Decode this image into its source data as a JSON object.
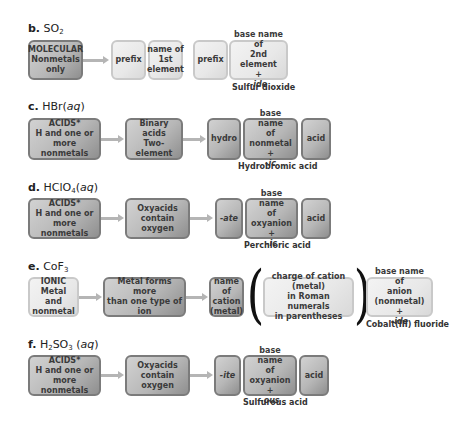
{
  "sections": {
    "b": {
      "letter": "b.",
      "formula_parts": [
        "SO",
        "2",
        ""
      ],
      "category_box": [
        "MOLECULAR",
        "Nonmetals",
        "only"
      ],
      "name_parts": [
        {
          "lines": [
            "prefix"
          ]
        },
        {
          "lines": [
            "name of",
            "1st",
            "element"
          ]
        },
        {
          "lines": [
            "prefix"
          ]
        },
        {
          "lines": [
            "base name of",
            "2nd element"
          ],
          "suffix_prefix": "+ ",
          "suffix": "-ide"
        }
      ],
      "example_name": "Sulfur dioxide"
    },
    "c": {
      "letter": "c.",
      "formula": "HBr",
      "phase": "aq",
      "category_box": [
        "ACIDS*",
        "H and one or",
        "more nonmetals"
      ],
      "subcategory_box": [
        "Binary acids",
        "Two-element"
      ],
      "name_parts": [
        {
          "lines": [
            "hydro"
          ]
        },
        {
          "lines": [
            "base name",
            "of nonmetal"
          ],
          "suffix_prefix": "+ ",
          "suffix": "-ic"
        },
        {
          "lines": [
            "acid"
          ]
        }
      ],
      "example_name": "Hydrobromic acid"
    },
    "d": {
      "letter": "d.",
      "formula_parts": [
        "HClO",
        "4",
        ""
      ],
      "phase": "aq",
      "category_box": [
        "ACIDS*",
        "H and one or",
        "more nonmetals"
      ],
      "subcategory_box": [
        "Oxyacids",
        "contain oxygen"
      ],
      "name_parts": [
        {
          "lines": [
            "-ate"
          ]
        },
        {
          "lines": [
            "base name",
            "of oxyanion"
          ],
          "suffix_prefix": "+ ",
          "suffix": "-ic"
        },
        {
          "lines": [
            "acid"
          ]
        }
      ],
      "example_name": "Perchloric acid"
    },
    "e": {
      "letter": "e.",
      "formula_parts": [
        "CoF",
        "3",
        ""
      ],
      "category_box": [
        "IONIC",
        "Metal and",
        "nonmetal"
      ],
      "subcategory_box": [
        "Metal forms more",
        "than one type of ion"
      ],
      "name_parts": [
        {
          "lines": [
            "name of",
            "cation",
            "(metal)"
          ]
        },
        {
          "lines": [
            "charge of cation (metal)",
            "in Roman numerals",
            "in parentheses"
          ]
        },
        {
          "lines": [
            "base name of",
            "anion (nonmetal)"
          ],
          "suffix_prefix": "+ ",
          "suffix": "-ide"
        }
      ],
      "example_name": "Cobalt(III) fluoride"
    },
    "f": {
      "letter": "f.",
      "formula_parts": [
        "H",
        "2",
        "SO",
        "3"
      ],
      "phase": "aq",
      "category_box": [
        "ACIDS*",
        "H and one or",
        "more nonmetals"
      ],
      "subcategory_box": [
        "Oxyacids",
        "contain oxygen"
      ],
      "name_parts": [
        {
          "lines": [
            "-ite"
          ]
        },
        {
          "lines": [
            "base name",
            "of oxyanion"
          ],
          "suffix_prefix": "+ ",
          "suffix": "-ous"
        },
        {
          "lines": [
            "acid"
          ]
        }
      ],
      "example_name": "Sulfurous acid"
    }
  },
  "glyphs": {
    "open_paren": "(",
    "close_paren": ")",
    "arrow": "arrow-right"
  }
}
